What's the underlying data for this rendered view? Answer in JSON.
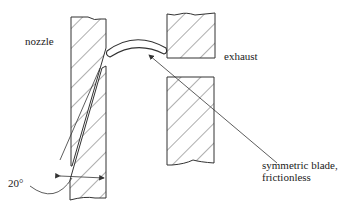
{
  "diagram": {
    "labels": {
      "nozzle": "nozzle",
      "exhaust": "exhaust",
      "blade_line1": "symmetric blade,",
      "blade_line2": "frictionless",
      "angle": "20°"
    },
    "colors": {
      "stroke": "#333333",
      "background": "#ffffff"
    }
  }
}
